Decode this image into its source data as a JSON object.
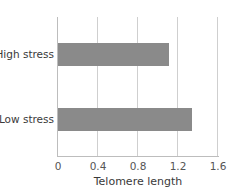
{
  "chart_data": {
    "type": "bar",
    "orientation": "horizontal",
    "title": "",
    "categories": [
      "High stress",
      "Low stress"
    ],
    "values": [
      1.11,
      1.34
    ],
    "xlabel": "Telomere length",
    "ylabel": "",
    "xlim": [
      0,
      1.6
    ],
    "xticks": [
      "0",
      "0.4",
      "0.8",
      "1.2",
      "1.6"
    ],
    "grid": true,
    "legend": null,
    "bar_color": "#8a8a8a"
  }
}
